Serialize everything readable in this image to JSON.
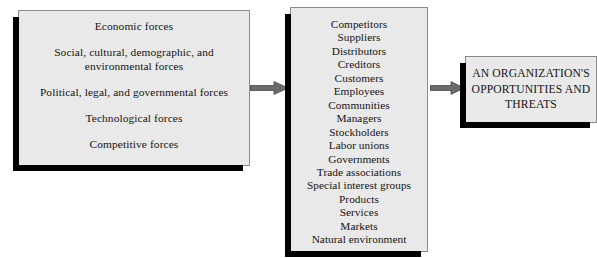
{
  "diagram": {
    "title": "",
    "fill_color": "#e9e9e9",
    "border_color": "#8a8a8a",
    "shadow_color": "#000000",
    "arrow_color": "#6b6b6b"
  },
  "external_forces_box": {
    "name": "External forces",
    "lines": [
      "Economic forces",
      "Social, cultural, demographic, and environmental forces",
      "Political, legal, and governmental forces",
      "Technological forces",
      "Competitive forces"
    ]
  },
  "stakeholders_box": {
    "name": "Stakeholders",
    "items": [
      "Competitors",
      "Suppliers",
      "Distributors",
      "Creditors",
      "Customers",
      "Employees",
      "Communities",
      "Managers",
      "Stockholders",
      "Labor unions",
      "Governments",
      "Trade associations",
      "Special interest groups",
      "Products",
      "Services",
      "Markets",
      "Natural environment"
    ]
  },
  "outcome_box": {
    "name": "Organization outcome",
    "lines": [
      "AN ORGANIZATION'S",
      "OPPORTUNITIES AND",
      "THREATS"
    ]
  },
  "arrows": [
    {
      "id": "arrow-external-to-stakeholders",
      "from": "external_forces_box",
      "to": "stakeholders_box",
      "direction": "right"
    },
    {
      "id": "arrow-stakeholders-to-outcome",
      "from": "stakeholders_box",
      "to": "outcome_box",
      "direction": "right"
    }
  ]
}
